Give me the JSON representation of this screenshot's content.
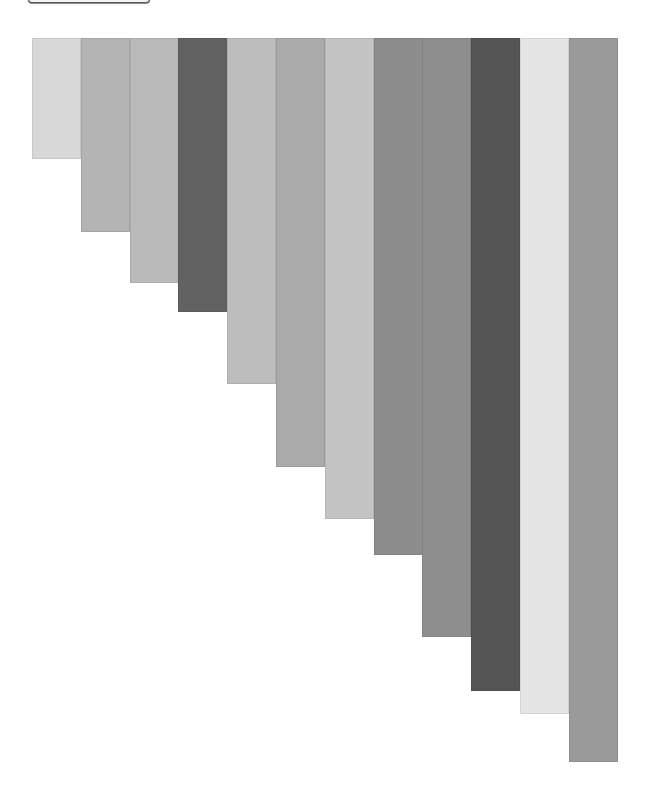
{
  "top_button": {
    "label": ""
  },
  "chart_data": {
    "type": "bar",
    "orientation": "vertical-hanging",
    "title": "",
    "xlabel": "",
    "ylabel": "",
    "grid": false,
    "legend": null,
    "categories": [
      "1",
      "2",
      "3",
      "4",
      "5",
      "6",
      "7",
      "8",
      "9",
      "10",
      "11",
      "12"
    ],
    "values": [
      121,
      194,
      245,
      274,
      346,
      429,
      481,
      517,
      599,
      653,
      676,
      724
    ],
    "colors": [
      "#d8d8d8",
      "#b4b4b4",
      "#bababa",
      "#626262",
      "#bdbdbd",
      "#aaaaaa",
      "#c4c4c4",
      "#8d8d8d",
      "#8e8e8e",
      "#555555",
      "#e5e5e5",
      "#9a9a9a"
    ],
    "ylim": [
      0,
      724
    ]
  },
  "layout": {
    "top": 38,
    "left": 32,
    "bar_width": 48.8
  }
}
